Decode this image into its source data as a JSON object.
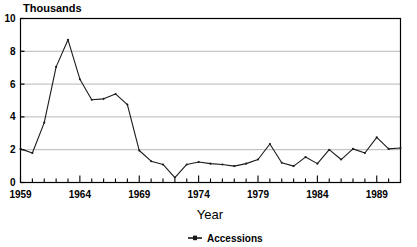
{
  "chart_data": {
    "type": "line",
    "title": "Thousands",
    "xlabel": "Year",
    "ylabel": "Thousands",
    "grid": true,
    "legend_position": "bottom",
    "xlim": [
      1959,
      1991
    ],
    "ylim": [
      0,
      10
    ],
    "yticks": [
      0,
      2,
      4,
      6,
      8,
      10
    ],
    "ytick_labels": [
      "0",
      "2",
      "4",
      "6",
      "8",
      "10"
    ],
    "xticks": [
      1959,
      1964,
      1969,
      1974,
      1979,
      1984,
      1989
    ],
    "xtick_labels": [
      "1959",
      "1964",
      "1969",
      "1974",
      "1979",
      "1984",
      "1989"
    ],
    "xtick_minor_step": 1,
    "series": [
      {
        "name": "Accessions",
        "color": "#1a1a1a",
        "marker": "dot",
        "x": [
          1959,
          1960,
          1961,
          1962,
          1963,
          1964,
          1965,
          1966,
          1967,
          1968,
          1969,
          1970,
          1971,
          1972,
          1973,
          1974,
          1975,
          1976,
          1977,
          1978,
          1979,
          1980,
          1981,
          1982,
          1983,
          1984,
          1985,
          1986,
          1987,
          1988,
          1989,
          1990,
          1991
        ],
        "values": [
          2.05,
          1.8,
          3.65,
          7.05,
          8.7,
          6.3,
          5.05,
          5.1,
          5.4,
          4.75,
          1.95,
          1.3,
          1.1,
          0.3,
          1.1,
          1.25,
          1.15,
          1.1,
          1.0,
          1.15,
          1.4,
          2.35,
          1.2,
          1.0,
          1.55,
          1.15,
          2.0,
          1.4,
          2.05,
          1.8,
          2.75,
          2.05,
          2.1
        ]
      }
    ]
  },
  "legend": {
    "items": [
      {
        "label": "Accessions",
        "color": "#1a1a1a"
      }
    ]
  },
  "axis": {
    "y_title": "Thousands",
    "x_title": "Year"
  }
}
